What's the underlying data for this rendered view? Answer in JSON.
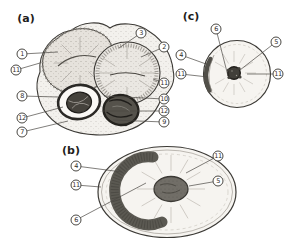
{
  "colors": {
    "paper": "#ffffff",
    "ink": "#3c3a36"
  },
  "panels": {
    "a": {
      "label": "(a)",
      "callouts": [
        "1",
        "11",
        "8",
        "12",
        "7",
        "3",
        "2",
        "11",
        "10",
        "12",
        "9"
      ]
    },
    "b": {
      "label": "(b)",
      "callouts": [
        "4",
        "11",
        "6",
        "11",
        "5"
      ]
    },
    "c": {
      "label": "(c)",
      "callouts": [
        "6",
        "5",
        "4",
        "11",
        "11"
      ]
    }
  }
}
